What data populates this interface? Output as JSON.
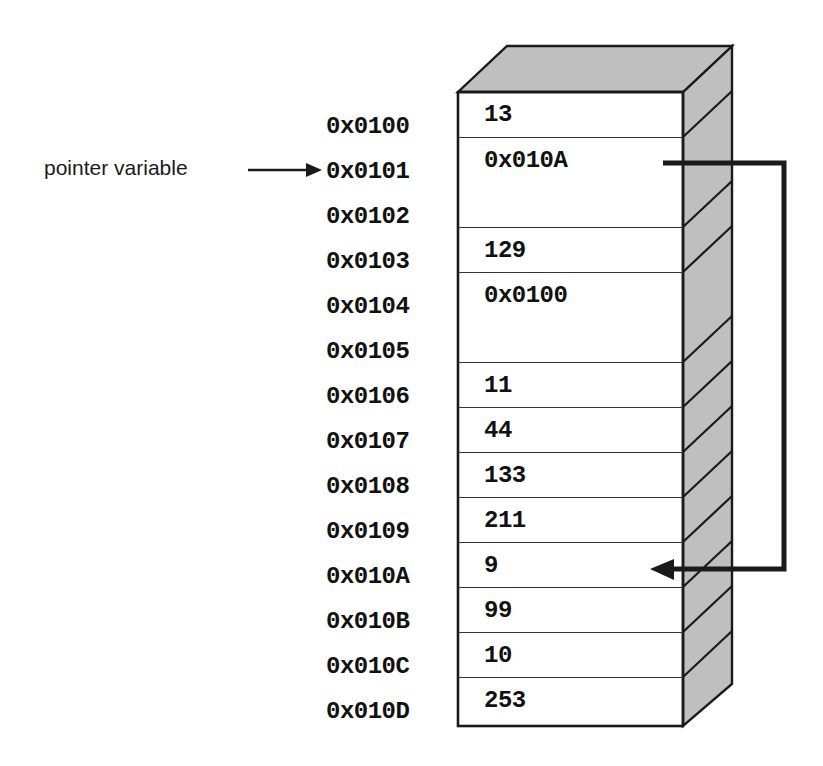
{
  "diagram": {
    "annotation": {
      "label": "pointer variable",
      "arrow_icon": "right-arrow-icon"
    },
    "memory": {
      "block_icon": "memory-block-3d-icon",
      "top_face_color": "#bfbfbf",
      "side_face_color": "#bfbfbf",
      "outline_color": "#1a1a1a",
      "cell_fill_color": "#ffffff",
      "addresses": [
        "0x0100",
        "0x0101",
        "0x0102",
        "0x0103",
        "0x0104",
        "0x0105",
        "0x0106",
        "0x0107",
        "0x0108",
        "0x0109",
        "0x010A",
        "0x010B",
        "0x010C",
        "0x010D"
      ],
      "cells": [
        {
          "address": "0x0100",
          "value": "13",
          "span": 1
        },
        {
          "address": "0x0101",
          "value": "0x010A",
          "span": 2
        },
        {
          "address": "0x0103",
          "value": "129",
          "span": 1
        },
        {
          "address": "0x0104",
          "value": "0x0100",
          "span": 2
        },
        {
          "address": "0x0106",
          "value": "11",
          "span": 1
        },
        {
          "address": "0x0107",
          "value": "44",
          "span": 1
        },
        {
          "address": "0x0108",
          "value": "133",
          "span": 1
        },
        {
          "address": "0x0109",
          "value": "211",
          "span": 1
        },
        {
          "address": "0x010A",
          "value": "9",
          "span": 1
        },
        {
          "address": "0x010B",
          "value": "99",
          "span": 1
        },
        {
          "address": "0x010C",
          "value": "10",
          "span": 1
        },
        {
          "address": "0x010D",
          "value": "253",
          "span": 1
        }
      ]
    },
    "pointer_link": {
      "icon": "pointer-link-arrow-icon",
      "from_address": "0x0101",
      "from_value": "0x010A",
      "to_address": "0x010A",
      "to_value": "9"
    }
  }
}
